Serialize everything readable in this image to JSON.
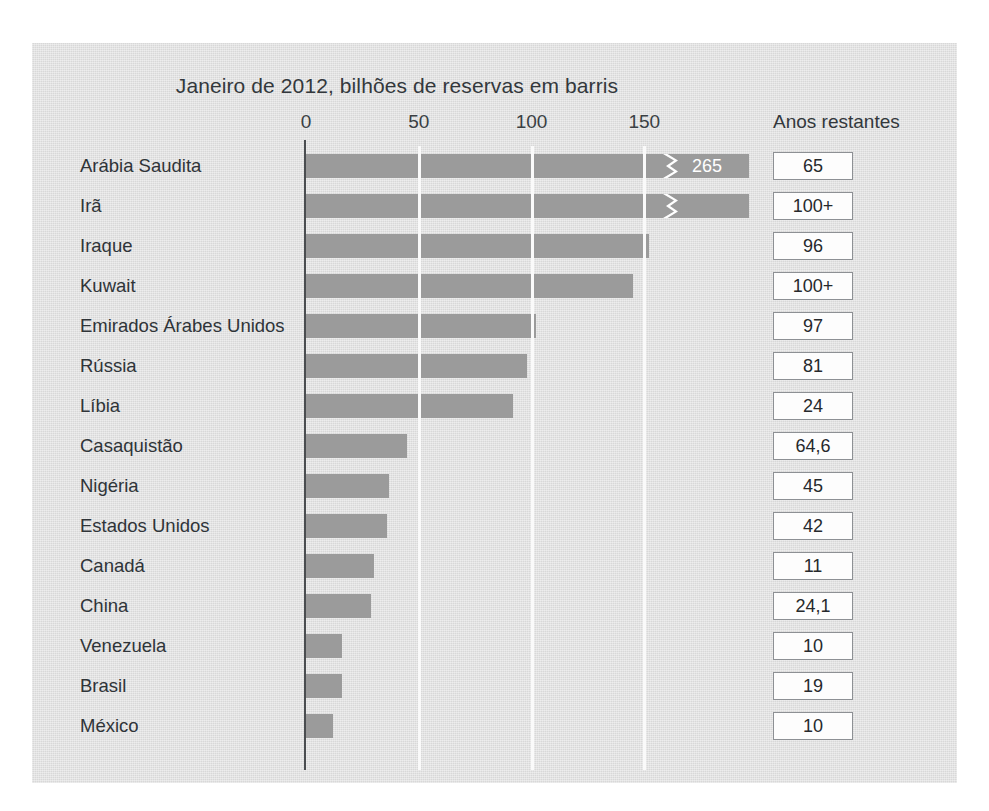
{
  "chart_data": {
    "type": "bar",
    "title": "Janeiro de 2012, bilhões de reservas em barris",
    "xlabel": "",
    "ylabel": "",
    "orientation": "horizontal",
    "xlim": [
      0,
      175
    ],
    "xticks": [
      0,
      50,
      100,
      150
    ],
    "xtick_labels": [
      "0",
      "50",
      "100",
      "150"
    ],
    "grid": "vertical-white",
    "legend": "none",
    "axis_break_note": "Primeira barra truncada com marca de quebra; valor real 265",
    "categories": [
      "Arábia Saudita",
      "Irã",
      "Iraque",
      "Kuwait",
      "Emirados Árabes Unidos",
      "Rússia",
      "Líbia",
      "Casaquistão",
      "Nigéria",
      "Estados Unidos",
      "Canadá",
      "China",
      "Venezuela",
      "Brasil",
      "México"
    ],
    "values": [
      265,
      193,
      152,
      145,
      102,
      98,
      92,
      45,
      37,
      36,
      30,
      29,
      16,
      16,
      12
    ],
    "data_labels": [
      "265",
      "",
      "",
      "",
      "",
      "",
      "",
      "",
      "",
      "",
      "",
      "",
      "",
      "",
      ""
    ],
    "secondary_column": {
      "header": "Anos restantes",
      "values": [
        "65",
        "100+",
        "96",
        "100+",
        "97",
        "81",
        "24",
        "64,6",
        "45",
        "42",
        "11",
        "24,1",
        "10",
        "19",
        "10"
      ]
    }
  },
  "style": {
    "bar_color": "#9b9b9b",
    "panel_background": "#dedede",
    "gridline_color": "#fafafa",
    "axis_color": "#4a4d50",
    "text_color": "#2f3438",
    "box_fill": "#fdfdfd",
    "box_border": "#8d9094"
  }
}
